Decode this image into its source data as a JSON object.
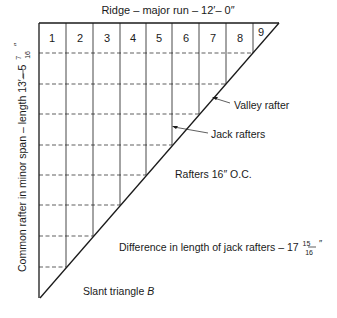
{
  "title": "Ridge – major run – 12′– 0″",
  "side_label": "Common rafter in minor span – length 13′– 5",
  "side_fraction": {
    "num": "7",
    "den": "16",
    "unit": "″"
  },
  "cells": [
    "1",
    "2",
    "3",
    "4",
    "5",
    "6",
    "7",
    "8",
    "9"
  ],
  "labels": {
    "valley": "Valley rafter",
    "jack": "Jack rafters",
    "spacing": "Rafters 16″ O.C.",
    "difference": "Difference in length of jack rafters – 17",
    "difference_fraction": {
      "num": "15",
      "den": "16",
      "unit": "″"
    },
    "slant": "Slant triangle ",
    "slant_italic": "B"
  },
  "colors": {
    "line": "#1a1a1a",
    "background": "#ffffff"
  }
}
